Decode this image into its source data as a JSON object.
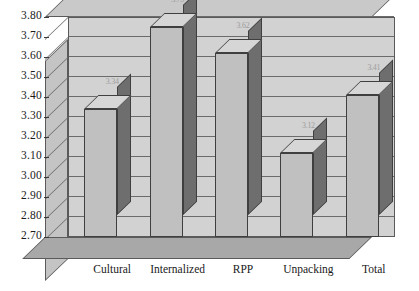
{
  "chart_data": {
    "type": "bar",
    "title": "",
    "subtitle": "",
    "xlabel": "",
    "ylabel": "",
    "categories": [
      "Cultural",
      "Internalized",
      "RPP",
      "Unpacking",
      "Total"
    ],
    "values": [
      3.34,
      3.75,
      3.62,
      3.12,
      3.41
    ],
    "value_labels": [
      "3.34",
      "3.75",
      "3.62",
      "3.12",
      "3.41"
    ],
    "ylim": [
      2.7,
      3.8
    ],
    "ytick_step": 0.1,
    "ytick_labels": [
      "3.80",
      "3.70",
      "3.60",
      "3.50",
      "3.40",
      "3.30",
      "3.20",
      "3.10",
      "3.00",
      "2.90",
      "2.80",
      "2.70"
    ],
    "grid": true,
    "legend": false,
    "legend_position": "none",
    "style": "3d-column",
    "colors": {
      "bar_front": "#c0c0c0",
      "bar_side": "#6e6e6e",
      "bar_top": "#d6d6d6",
      "wall_back": "#d2d2d2",
      "wall_left": "#c4c4c4",
      "wall_top": "#c9c9c9",
      "floor": "#a8a8a8",
      "gridline": "#6b6b6b",
      "outline": "#3f3f3f",
      "text": "#1a1a1a",
      "background": "#ffffff"
    }
  }
}
